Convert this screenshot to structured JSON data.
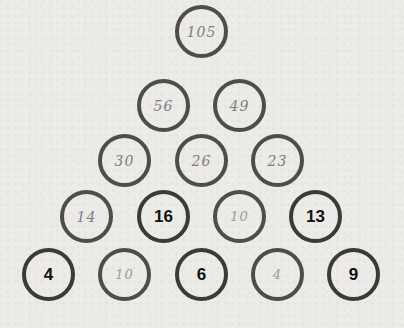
{
  "puzzle": {
    "type": "number-pyramid",
    "rule_hint": "each circle is the sum of the two circles directly below it",
    "rows": [
      [
        {
          "value": "105",
          "style": "handwritten"
        }
      ],
      [
        {
          "value": "56",
          "style": "handwritten"
        },
        {
          "value": "49",
          "style": "handwritten"
        }
      ],
      [
        {
          "value": "30",
          "style": "handwritten"
        },
        {
          "value": "26",
          "style": "handwritten"
        },
        {
          "value": "23",
          "style": "handwritten"
        }
      ],
      [
        {
          "value": "14",
          "style": "handwritten"
        },
        {
          "value": "16",
          "style": "printed"
        },
        {
          "value": "10",
          "style": "handwritten"
        },
        {
          "value": "13",
          "style": "printed"
        }
      ],
      [
        {
          "value": "4",
          "style": "printed"
        },
        {
          "value": "10",
          "style": "handwritten"
        },
        {
          "value": "6",
          "style": "printed"
        },
        {
          "value": "4",
          "style": "handwritten"
        },
        {
          "value": "9",
          "style": "printed"
        }
      ]
    ]
  },
  "colors": {
    "background": "#ecebe8",
    "circle_border": "#4a4a4a",
    "printed_text": "#111111",
    "handwritten_text": "#7d7d7d"
  }
}
